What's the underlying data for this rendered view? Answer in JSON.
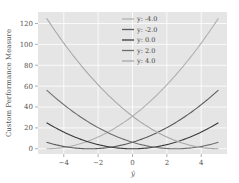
{
  "chart_data": {
    "type": "line",
    "title": "",
    "xlabel": "ŷ",
    "ylabel": "Custom Performance Measure",
    "xlim": [
      -5.5,
      5.5
    ],
    "ylim": [
      -5,
      131
    ],
    "xticks": [
      -4,
      -2,
      0,
      2,
      4
    ],
    "xtick_labels": [
      "−4",
      "−2",
      "0",
      "2",
      "4"
    ],
    "yticks": [
      0,
      20,
      40,
      60,
      80,
      100,
      120
    ],
    "ytick_labels": [
      "0",
      "20",
      "40",
      "60",
      "80",
      "100",
      "120"
    ],
    "grid": true,
    "legend_position": "upper center",
    "x": [
      -5,
      -4,
      -3,
      -2,
      -1,
      0,
      1,
      2,
      3,
      4,
      5
    ],
    "series": [
      {
        "name": "y: -4.0",
        "color": "#b0b0b0",
        "values": [
          1,
          0,
          1,
          4,
          9,
          16,
          25,
          36,
          49,
          64,
          81
        ]
      },
      {
        "name": "y: -2.0",
        "color": "#5a5a5a",
        "values": [
          9,
          4,
          1,
          0,
          1,
          4,
          9,
          16,
          25,
          36,
          49
        ]
      },
      {
        "name": "y: 0.0",
        "color": "#3a3a3a",
        "values": [
          25,
          16,
          9,
          4,
          1,
          0,
          1,
          4,
          9,
          16,
          25
        ]
      },
      {
        "name": "y: 2.0",
        "color": "#6e6e6e",
        "values": [
          49,
          36,
          25,
          16,
          9,
          4,
          1,
          0,
          1,
          4,
          9
        ]
      },
      {
        "name": "y: 4.0",
        "color": "#a8a8a8",
        "values": [
          81,
          64,
          49,
          36,
          25,
          16,
          9,
          4,
          1,
          0,
          1
        ]
      }
    ],
    "curves_pixel_estimate": [
      {
        "name": "y: -4.0",
        "left_end": 0,
        "right_end": 125
      },
      {
        "name": "y: -2.0",
        "left_end": 7,
        "right_end": 62
      },
      {
        "name": "y: 0.0",
        "left_end": 25,
        "right_end": 25
      },
      {
        "name": "y: 2.0",
        "left_end": 62,
        "right_end": 7
      },
      {
        "name": "y: 4.0",
        "left_end": 125,
        "right_end": 0
      }
    ]
  }
}
